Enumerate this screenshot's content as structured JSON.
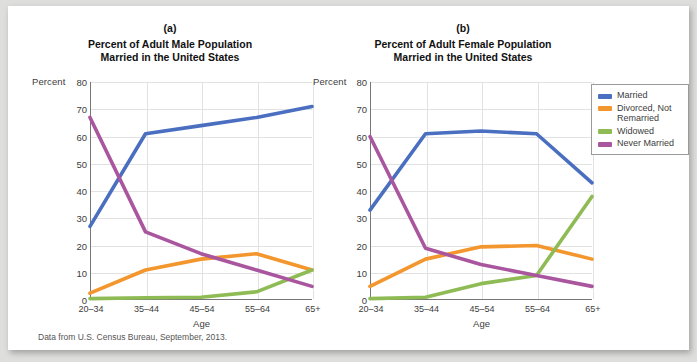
{
  "source_note": "Data from U.S. Census Bureau, September, 2013.",
  "axis": {
    "y_label": "Percent",
    "x_label": "Age",
    "y_ticks": [
      0,
      10,
      20,
      30,
      40,
      50,
      60,
      70,
      80
    ],
    "categories": [
      "20–34",
      "35–44",
      "45–54",
      "55–64",
      "65+"
    ]
  },
  "legend": {
    "items": [
      {
        "label": "Married",
        "color": "#4a6fc0"
      },
      {
        "label": "Divorced, Not Remarried",
        "color": "#f2962d"
      },
      {
        "label": "Widowed",
        "color": "#8fbb55"
      },
      {
        "label": "Never Married",
        "color": "#a9569f"
      }
    ]
  },
  "panels": [
    {
      "letter": "(a)",
      "title_line1": "Percent of Adult Male Population",
      "title_line2": "Married in the United States"
    },
    {
      "letter": "(b)",
      "title_line1": "Percent of Adult Female Population",
      "title_line2": "Married in the United States"
    }
  ],
  "chart_data": [
    {
      "type": "line",
      "title": "Percent of Adult Male Population Married in the United States",
      "panel": "(a)",
      "xlabel": "Age",
      "ylabel": "Percent",
      "ylim": [
        0,
        80
      ],
      "grid": true,
      "legend_position": "right-outside",
      "categories": [
        "20–34",
        "35–44",
        "45–54",
        "55–64",
        "65+"
      ],
      "series": [
        {
          "name": "Married",
          "color": "#4a6fc0",
          "values": [
            27,
            61,
            64,
            67,
            71
          ]
        },
        {
          "name": "Divorced, Not Remarried",
          "color": "#f2962d",
          "values": [
            2.5,
            11,
            15,
            17,
            11
          ]
        },
        {
          "name": "Widowed",
          "color": "#8fbb55",
          "values": [
            0.5,
            0.8,
            1,
            3,
            11
          ]
        },
        {
          "name": "Never Married",
          "color": "#a9569f",
          "values": [
            67,
            25,
            17,
            11,
            5
          ]
        }
      ]
    },
    {
      "type": "line",
      "title": "Percent of Adult Female Population Married in the United States",
      "panel": "(b)",
      "xlabel": "Age",
      "ylabel": "Percent",
      "ylim": [
        0,
        80
      ],
      "grid": true,
      "legend_position": "right-outside",
      "categories": [
        "20–34",
        "35–44",
        "45–54",
        "55–64",
        "65+"
      ],
      "series": [
        {
          "name": "Married",
          "color": "#4a6fc0",
          "values": [
            33,
            61,
            62,
            61,
            43
          ]
        },
        {
          "name": "Divorced, Not Remarried",
          "color": "#f2962d",
          "values": [
            5,
            15,
            19.5,
            20,
            15
          ]
        },
        {
          "name": "Widowed",
          "color": "#8fbb55",
          "values": [
            0.5,
            1,
            6,
            9,
            38
          ]
        },
        {
          "name": "Never Married",
          "color": "#a9569f",
          "values": [
            60,
            19,
            13,
            9,
            5
          ]
        }
      ]
    }
  ]
}
